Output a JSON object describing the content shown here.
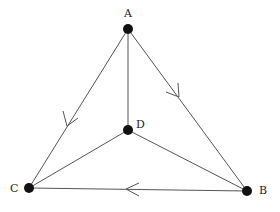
{
  "graph": {
    "nodes": [
      {
        "id": "A",
        "label": "A",
        "x": 128,
        "y": 29,
        "label_x": 124,
        "label_y": 16
      },
      {
        "id": "D",
        "label": "D",
        "x": 128,
        "y": 130,
        "label_x": 136,
        "label_y": 127
      },
      {
        "id": "C",
        "label": "C",
        "x": 29,
        "y": 188,
        "label_x": 10,
        "label_y": 192
      },
      {
        "id": "B",
        "label": "B",
        "x": 247,
        "y": 191,
        "label_x": 259,
        "label_y": 193
      }
    ],
    "edges": [
      {
        "from": "A",
        "to": "C",
        "directed": true,
        "arrow_direction": "toward C"
      },
      {
        "from": "A",
        "to": "B",
        "directed": true,
        "arrow_direction": "toward B"
      },
      {
        "from": "B",
        "to": "C",
        "directed": true,
        "arrow_direction": "toward C"
      },
      {
        "from": "A",
        "to": "D",
        "directed": false
      },
      {
        "from": "D",
        "to": "C",
        "directed": false
      },
      {
        "from": "D",
        "to": "B",
        "directed": false
      }
    ]
  },
  "colors": {
    "node": "#111111",
    "edge": "#555555",
    "label": "#222222",
    "background": "#ffffff"
  }
}
